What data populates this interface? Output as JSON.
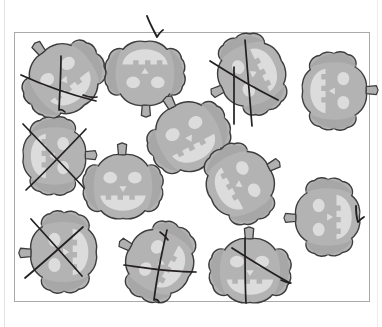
{
  "page": {
    "background_color": "#ffffff",
    "width": 382,
    "height": 327
  },
  "frame": {
    "name": "worksheet-frame",
    "x": 14,
    "y": 32,
    "width": 356,
    "height": 270,
    "border_color": "#a9a9a9",
    "fill_color": "#ffffff"
  },
  "palette": {
    "pumpkin_body": "#b3b3b3",
    "pumpkin_body_shade": "#a3a3a3",
    "pumpkin_outline": "#3d3d3d",
    "pumpkin_face": "#dcdcdc",
    "pumpkin_highlight": "#c8c8c8",
    "stem": "#b0b0b0",
    "ink": "#231f20",
    "page_rule": "#e3e3e3"
  },
  "pumpkins": [
    {
      "id": "pumpkin-1",
      "label": "Pumpkin 1",
      "x": 20,
      "y": 38,
      "w": 88,
      "h": 82,
      "rotation": -38,
      "marked": true,
      "mark": "slash-and-bar"
    },
    {
      "id": "pumpkin-2",
      "label": "Pumpkin 2",
      "x": 104,
      "y": 34,
      "w": 82,
      "h": 78,
      "rotation": 180,
      "marked": false,
      "mark": "none"
    },
    {
      "id": "pumpkin-3",
      "label": "Pumpkin 3",
      "x": 210,
      "y": 34,
      "w": 84,
      "h": 80,
      "rotation": -115,
      "marked": true,
      "mark": "cross"
    },
    {
      "id": "pumpkin-4",
      "label": "Pumpkin 4",
      "x": 294,
      "y": 52,
      "w": 80,
      "h": 78,
      "rotation": 90,
      "marked": false,
      "mark": "none"
    },
    {
      "id": "pumpkin-5",
      "label": "Pumpkin 5",
      "x": 14,
      "y": 118,
      "w": 80,
      "h": 76,
      "rotation": 90,
      "marked": true,
      "mark": "x"
    },
    {
      "id": "pumpkin-6",
      "label": "Pumpkin 6",
      "x": 146,
      "y": 96,
      "w": 86,
      "h": 82,
      "rotation": -28,
      "marked": false,
      "mark": "none"
    },
    {
      "id": "pumpkin-7",
      "label": "Pumpkin 7",
      "x": 82,
      "y": 148,
      "w": 82,
      "h": 78,
      "rotation": 0,
      "marked": false,
      "mark": "none"
    },
    {
      "id": "pumpkin-8",
      "label": "Pumpkin 8",
      "x": 198,
      "y": 144,
      "w": 84,
      "h": 80,
      "rotation": 62,
      "marked": false,
      "mark": "none"
    },
    {
      "id": "pumpkin-9",
      "label": "Pumpkin 9",
      "x": 288,
      "y": 178,
      "w": 80,
      "h": 78,
      "rotation": -90,
      "marked": false,
      "mark": "none"
    },
    {
      "id": "pumpkin-10",
      "label": "Pumpkin 10",
      "x": 22,
      "y": 212,
      "w": 84,
      "h": 80,
      "rotation": -90,
      "marked": true,
      "mark": "x"
    },
    {
      "id": "pumpkin-11",
      "label": "Pumpkin 11",
      "x": 118,
      "y": 222,
      "w": 84,
      "h": 80,
      "rotation": -62,
      "marked": true,
      "mark": "cross"
    },
    {
      "id": "pumpkin-12",
      "label": "Pumpkin 12",
      "x": 208,
      "y": 232,
      "w": 84,
      "h": 78,
      "rotation": 0,
      "marked": true,
      "mark": "slash-and-bar"
    }
  ],
  "ink_marks": [
    {
      "id": "mark-top-check",
      "label": "Check stroke above top pumpkin",
      "kind": "check-stroke"
    },
    {
      "id": "mark-right-check",
      "label": "Check stroke at right edge",
      "kind": "check-stroke"
    },
    {
      "id": "mark-p1-slash",
      "label": "Slash over pumpkin 1",
      "kind": "slash"
    },
    {
      "id": "mark-p1-bar",
      "label": "Vertical bar over pumpkin 1",
      "kind": "bar"
    },
    {
      "id": "mark-p3-slash",
      "label": "Slash over pumpkin 3",
      "kind": "slash"
    },
    {
      "id": "mark-p3-bar",
      "label": "Vertical bar over pumpkin 3",
      "kind": "bar"
    },
    {
      "id": "mark-p5-x",
      "label": "X over pumpkin 5",
      "kind": "x"
    },
    {
      "id": "mark-p10-x",
      "label": "X over pumpkin 10",
      "kind": "x"
    },
    {
      "id": "mark-p11-slash",
      "label": "Slash over pumpkin 11",
      "kind": "slash"
    },
    {
      "id": "mark-p11-bar",
      "label": "Curved bar over pumpkin 11",
      "kind": "bar"
    },
    {
      "id": "mark-p12-slash",
      "label": "Slash over pumpkin 12",
      "kind": "slash"
    },
    {
      "id": "mark-p12-bar",
      "label": "Vertical bar over pumpkin 12",
      "kind": "bar"
    }
  ],
  "counts": {
    "total_pumpkins": 12,
    "marked_pumpkins": 6,
    "unmarked_pumpkins": 6
  }
}
